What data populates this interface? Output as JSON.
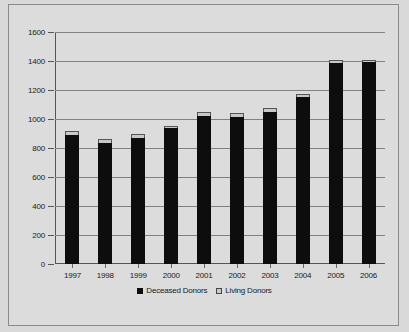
{
  "chart_data": {
    "type": "bar",
    "subtype": "stacked-column",
    "title": "",
    "xlabel": "",
    "ylabel": "",
    "ylim": [
      0,
      1600
    ],
    "ytick_step": 200,
    "yticks": [
      "0",
      "200",
      "400",
      "600",
      "800",
      "1000",
      "1200",
      "1400",
      "1600"
    ],
    "grid": true,
    "legend_position": "bottom",
    "categories": [
      "1997",
      "1998",
      "1999",
      "2000",
      "2001",
      "2002",
      "2003",
      "2004",
      "2005",
      "2006"
    ],
    "series": [
      {
        "name": "Deceased Donors",
        "color": "#0d0d0d",
        "values": [
          890,
          835,
          870,
          935,
          1020,
          1015,
          1050,
          1150,
          1385,
          1390
        ]
      },
      {
        "name": "Living Donors",
        "color": "#c8c8c8",
        "values": [
          25,
          25,
          25,
          20,
          25,
          25,
          25,
          25,
          25,
          20
        ]
      }
    ],
    "totals": [
      915,
      860,
      895,
      955,
      1045,
      1040,
      1075,
      1175,
      1410,
      1410
    ]
  },
  "legend": {
    "items": [
      {
        "label": "Deceased Donors",
        "marker": "filled-square-black"
      },
      {
        "label": "Living Donors",
        "marker": "filled-square-gray"
      }
    ]
  },
  "colors": {
    "plot_background": "#dcdcdc",
    "page_background": "#d9d9d9",
    "gridline": "#808080",
    "axis": "#555555",
    "border": "#8a8a8a",
    "text": "#1a1a1a"
  }
}
